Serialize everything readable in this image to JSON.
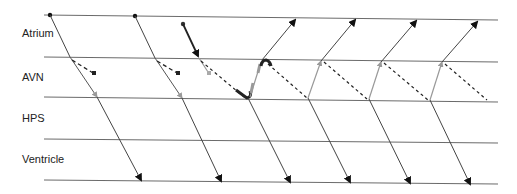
{
  "diagram": {
    "type": "ladder-diagram",
    "tiers": [
      {
        "id": "atrium",
        "label": "Atrium"
      },
      {
        "id": "avn",
        "label": "AVN"
      },
      {
        "id": "hps",
        "label": "HPS"
      },
      {
        "id": "ventricle",
        "label": "Ventricle"
      }
    ],
    "colors": {
      "tier_line": "#6b6b6b",
      "conduction": "#444444",
      "retrograde_gray": "#8a8a8a",
      "dashed": "#333333",
      "emphasis": "#222222"
    },
    "beats": [
      {
        "name": "beat-1",
        "origin": "atrium",
        "blocked_pathway": "dashed",
        "conducted": true
      },
      {
        "name": "beat-2",
        "origin": "atrium",
        "blocked_pathway": "dashed",
        "conducted": true
      },
      {
        "name": "beat-3",
        "origin": "atrium",
        "blocked_pathway": "dotted",
        "initiates_echo": true
      },
      {
        "name": "echo-1",
        "origin": "avn-reentry"
      },
      {
        "name": "echo-2",
        "origin": "avn-reentry"
      },
      {
        "name": "echo-3",
        "origin": "avn-reentry"
      },
      {
        "name": "echo-4",
        "origin": "avn-reentry"
      }
    ]
  }
}
